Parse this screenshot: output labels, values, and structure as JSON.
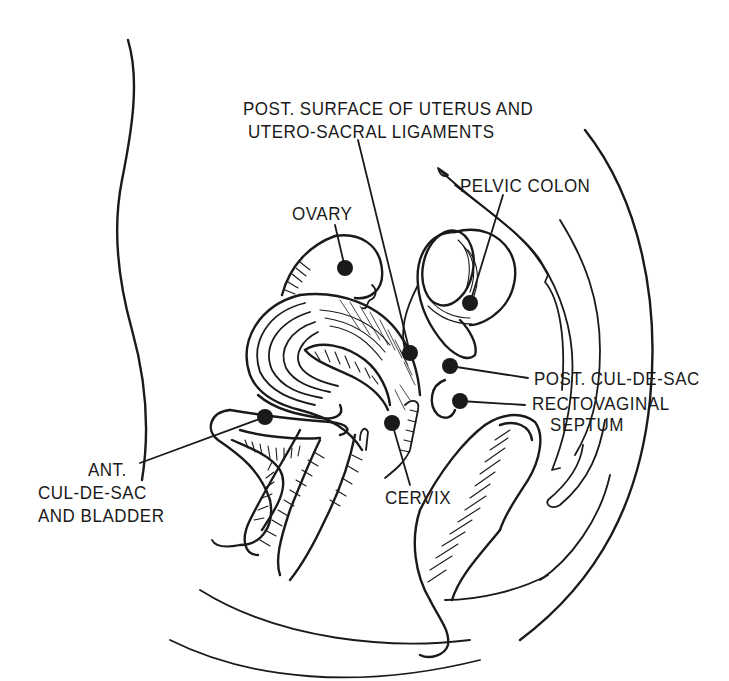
{
  "figure": {
    "type": "anatomical line drawing",
    "view": "sagittal section of female pelvis",
    "ink_color": "#1a1a1a",
    "background_color": "#ffffff"
  },
  "labels": {
    "post_surface_uterus": {
      "line1": "POST. SURFACE OF UTERUS AND",
      "line2": "UTERO-SACRAL LIGAMENTS"
    },
    "pelvic_colon": "PELVIC COLON",
    "ovary": "OVARY",
    "post_cul_de_sac": "POST. CUL-DE-SAC",
    "rectovaginal_septum": {
      "line1": "RECTOVAGINAL",
      "line2": "SEPTUM"
    },
    "ant_cul_de_sac": {
      "line1": "ANT.",
      "line2": "CUL-DE-SAC",
      "line3": "AND BLADDER"
    },
    "cervix": "CERVIX"
  },
  "markers": [
    {
      "id": "ovary",
      "x": 345,
      "y": 268
    },
    {
      "id": "post-surface-uterus",
      "x": 410,
      "y": 353
    },
    {
      "id": "pelvic-colon",
      "x": 470,
      "y": 303
    },
    {
      "id": "post-cul-de-sac",
      "x": 450,
      "y": 366
    },
    {
      "id": "rectovaginal-septum",
      "x": 460,
      "y": 401
    },
    {
      "id": "ant-cul-de-sac",
      "x": 265,
      "y": 417
    },
    {
      "id": "cervix",
      "x": 392,
      "y": 423
    }
  ]
}
